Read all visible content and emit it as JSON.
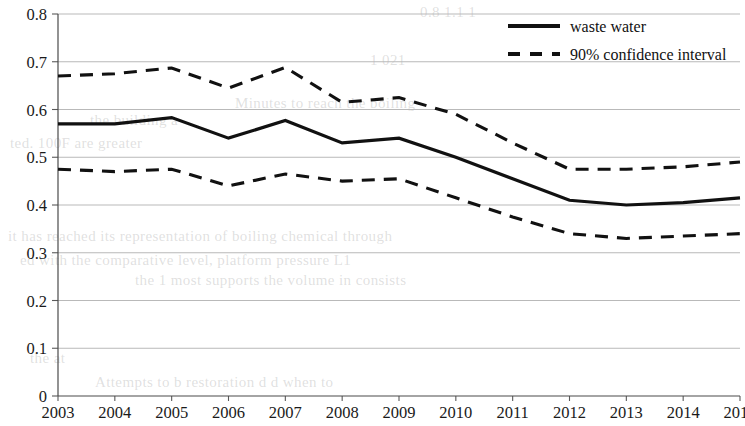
{
  "chart_data": {
    "type": "line",
    "title": "",
    "xlabel": "",
    "ylabel": "",
    "x": [
      "2003",
      "2004",
      "2005",
      "2006",
      "2007",
      "2008",
      "2009",
      "2010",
      "2011",
      "2012",
      "2013",
      "2014",
      "2015"
    ],
    "xlim": [
      2003,
      2015
    ],
    "ylim": [
      0,
      0.8
    ],
    "yticks": [
      "0",
      "0.1",
      "0.2",
      "0.3",
      "0.4",
      "0.5",
      "0.6",
      "0.7",
      "0.8"
    ],
    "ytick_values": [
      0,
      0.1,
      0.2,
      0.3,
      0.4,
      0.5,
      0.6,
      0.7,
      0.8
    ],
    "grid": true,
    "grid_axis": "y",
    "legend_position": "top-right",
    "series": [
      {
        "name": "waste water",
        "style": "solid",
        "color": "#111111",
        "values": [
          0.57,
          0.57,
          0.583,
          0.54,
          0.577,
          0.53,
          0.54,
          0.5,
          0.455,
          0.41,
          0.4,
          0.405,
          0.415
        ]
      },
      {
        "name": "90% confidence interval",
        "style": "dashed",
        "color": "#111111",
        "bound": "upper",
        "values": [
          0.67,
          0.675,
          0.687,
          0.645,
          0.688,
          0.615,
          0.625,
          0.59,
          0.53,
          0.475,
          0.475,
          0.48,
          0.49
        ]
      },
      {
        "name": "90% confidence interval",
        "style": "dashed",
        "color": "#111111",
        "bound": "lower",
        "values": [
          0.475,
          0.47,
          0.475,
          0.44,
          0.465,
          0.45,
          0.455,
          0.415,
          0.375,
          0.34,
          0.33,
          0.335,
          0.34
        ]
      }
    ]
  },
  "legend": {
    "items": [
      {
        "label": "waste water",
        "style": "solid"
      },
      {
        "label": "90% confidence interval",
        "style": "dashed"
      }
    ]
  },
  "background_text": {
    "lines": [
      {
        "text": "0.8  1.1  1",
        "x": 420,
        "y": 4
      },
      {
        "text": "1  021",
        "x": 370,
        "y": 52
      },
      {
        "text": "Minutes to reach the boiling",
        "x": 235,
        "y": 95
      },
      {
        "text": "ted. 100F are greater",
        "x": 10,
        "y": 135
      },
      {
        "text": "the building a",
        "x": 90,
        "y": 112
      },
      {
        "text": "it has reached its representation of boiling chemical through",
        "x": 8,
        "y": 228
      },
      {
        "text": "ed with the comparative level, platform pressure L1",
        "x": 20,
        "y": 252
      },
      {
        "text": "the 1 most supports the volume  in consists",
        "x": 135,
        "y": 272
      },
      {
        "text": "Attempts to b restoration d d when to",
        "x": 95,
        "y": 374
      },
      {
        "text": "the at",
        "x": 30,
        "y": 350
      }
    ]
  }
}
